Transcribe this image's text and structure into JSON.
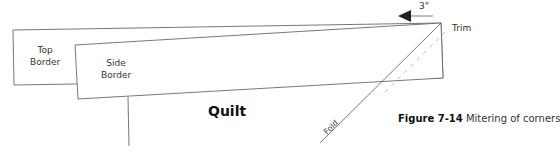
{
  "diagram": {
    "labels": {
      "top_border": [
        "Top",
        "Border"
      ],
      "side_border": [
        "Side",
        "Border"
      ],
      "quilt": "Quilt",
      "fold": "Fold",
      "trim": "Trim",
      "measure": "3\""
    },
    "caption": {
      "number": "Figure 7-14",
      "text": "Mitering of corners"
    },
    "colors": {
      "line": "#555555",
      "dashed": "#aaaaaa",
      "arrow": "#222222"
    }
  }
}
